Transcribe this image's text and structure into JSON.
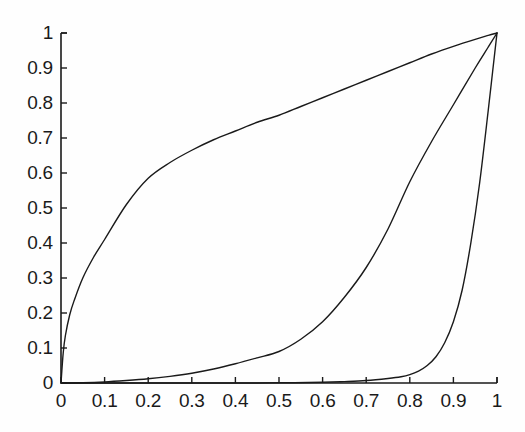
{
  "chart_data": {
    "type": "line",
    "title": "",
    "subtitle": "",
    "xlabel": "",
    "ylabel": "",
    "xlim": [
      0,
      1
    ],
    "ylim": [
      0,
      1
    ],
    "grid": false,
    "legend": "none",
    "background_color": "#ffffff",
    "line_color": "#1a1a1a",
    "axis_color": "#1a1a1a",
    "x_ticks": [
      "0",
      "0.1",
      "0.2",
      "0.3",
      "0.4",
      "0.5",
      "0.6",
      "0.7",
      "0.8",
      "0.9",
      "1"
    ],
    "x_tick_values": [
      0,
      0.1,
      0.2,
      0.3,
      0.4,
      0.5,
      0.6,
      0.7,
      0.8,
      0.9,
      1
    ],
    "y_ticks": [
      "0",
      "0.1",
      "0.2",
      "0.3",
      "0.4",
      "0.5",
      "0.6",
      "0.7",
      "0.8",
      "0.9",
      "1"
    ],
    "y_tick_values": [
      0,
      0.1,
      0.2,
      0.3,
      0.4,
      0.5,
      0.6,
      0.7,
      0.8,
      0.9,
      1
    ],
    "series": [
      {
        "name": "upper-concave-curve",
        "x": [
          0,
          0.005,
          0.01,
          0.02,
          0.03,
          0.05,
          0.075,
          0.1,
          0.15,
          0.2,
          0.25,
          0.3,
          0.35,
          0.4,
          0.45,
          0.5,
          0.55,
          0.6,
          0.65,
          0.7,
          0.75,
          0.8,
          0.85,
          0.9,
          0.95,
          0.98,
          1
        ],
        "y": [
          0,
          0.085,
          0.135,
          0.195,
          0.235,
          0.3,
          0.36,
          0.41,
          0.51,
          0.585,
          0.63,
          0.665,
          0.695,
          0.72,
          0.745,
          0.765,
          0.79,
          0.815,
          0.84,
          0.865,
          0.89,
          0.915,
          0.94,
          0.962,
          0.982,
          0.993,
          1
        ]
      },
      {
        "name": "middle-convex-curve",
        "x": [
          0,
          0.05,
          0.1,
          0.15,
          0.2,
          0.25,
          0.3,
          0.35,
          0.4,
          0.45,
          0.5,
          0.55,
          0.6,
          0.65,
          0.7,
          0.75,
          0.8,
          0.85,
          0.9,
          0.95,
          0.98,
          1
        ],
        "y": [
          0,
          0.0008,
          0.003,
          0.007,
          0.012,
          0.019,
          0.028,
          0.04,
          0.055,
          0.072,
          0.09,
          0.125,
          0.175,
          0.245,
          0.33,
          0.44,
          0.575,
          0.69,
          0.795,
          0.9,
          0.96,
          1
        ]
      },
      {
        "name": "right-steep-curve",
        "x": [
          0,
          0.1,
          0.2,
          0.3,
          0.4,
          0.5,
          0.6,
          0.65,
          0.7,
          0.75,
          0.78,
          0.8,
          0.82,
          0.84,
          0.86,
          0.88,
          0.9,
          0.92,
          0.94,
          0.96,
          0.98,
          0.99,
          1
        ],
        "y": [
          0,
          0,
          0,
          0,
          0,
          0.0005,
          0.002,
          0.004,
          0.007,
          0.013,
          0.018,
          0.024,
          0.034,
          0.05,
          0.075,
          0.115,
          0.175,
          0.265,
          0.4,
          0.57,
          0.78,
          0.89,
          1
        ]
      }
    ]
  },
  "axes": {
    "plot_left_px": 61,
    "plot_right_px": 497,
    "plot_top_px": 33,
    "plot_bottom_px": 383
  }
}
